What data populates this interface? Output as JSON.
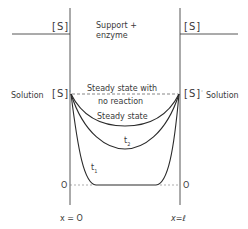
{
  "diagram": {
    "labels": {
      "region_center": "Support +",
      "region_center_2": "enzyme",
      "bulk_left": "[S]",
      "bulk_right": "[S]",
      "solution_left": "Solution",
      "solution_right": "Solution",
      "interface_left": "[S]",
      "interface_right": "[S]",
      "interface_mark": "'",
      "curve_no_reaction_1": "Steady state with",
      "curve_no_reaction_2": "no reaction",
      "curve_steady": "Steady state",
      "curve_t2": "t",
      "curve_t2_sub": "2",
      "curve_t1": "t",
      "curve_t1_sub": "1",
      "zero_left": "O",
      "zero_right": "O",
      "x_left": "x = O",
      "x_right": "x=ℓ"
    },
    "curves": [
      {
        "name": "Steady state with no reaction",
        "style": "dashed"
      },
      {
        "name": "Steady state",
        "style": "solid"
      },
      {
        "name": "t2",
        "style": "solid"
      },
      {
        "name": "t1",
        "style": "solid"
      }
    ],
    "colors": {
      "line": "#333333",
      "text": "#3a3a3a",
      "background": "#ffffff"
    }
  }
}
